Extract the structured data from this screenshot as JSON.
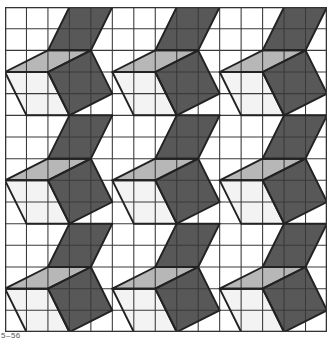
{
  "figure": {
    "caption": "5–56",
    "grid": {
      "columns": 15,
      "rows": 15,
      "line_color": "#3a3a3a",
      "border_color": "#333333"
    },
    "tile": {
      "size": 5,
      "repeat_x": 3,
      "repeat_y": 3,
      "shapes": [
        {
          "name": "white-face",
          "fill": "#f3f3f3",
          "points": [
            [
              0,
              3
            ],
            [
              2,
              3
            ],
            [
              3,
              5
            ],
            [
              1,
              5
            ]
          ]
        },
        {
          "name": "light-face",
          "fill": "#b7b7b7",
          "points": [
            [
              0,
              3
            ],
            [
              2,
              2
            ],
            [
              4,
              2
            ],
            [
              2,
              3
            ]
          ]
        },
        {
          "name": "dark-upper-face",
          "fill": "#585858",
          "points": [
            [
              3,
              0
            ],
            [
              5,
              0
            ],
            [
              4,
              2
            ],
            [
              2,
              2
            ]
          ]
        },
        {
          "name": "dark-lower-face",
          "fill": "#585858",
          "points": [
            [
              2,
              3
            ],
            [
              4,
              2
            ],
            [
              5,
              4
            ],
            [
              3,
              5
            ]
          ]
        }
      ]
    },
    "colors": {
      "background": "#ffffff",
      "outline": "#222222"
    }
  }
}
